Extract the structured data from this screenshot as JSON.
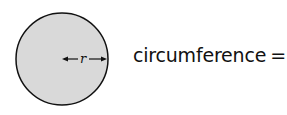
{
  "diagram": {
    "shape": "circle",
    "fill_color": "#d9d9d9",
    "stroke_color": "#111111",
    "radius_label": "r"
  },
  "formula": {
    "lhs": "circumference",
    "equals": "=",
    "coefficient": "2",
    "pi": "π",
    "variable": "r"
  }
}
